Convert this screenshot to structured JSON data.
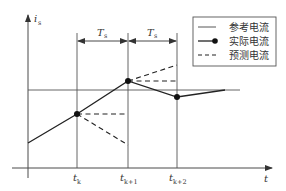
{
  "diagram": {
    "type": "predictive-current-control-timing",
    "axes": {
      "y_label_main": "i",
      "y_label_sub": "s",
      "x_label": "t"
    },
    "time_ticks": [
      {
        "main": "t",
        "sub": "k"
      },
      {
        "main": "t",
        "sub": "k+1"
      },
      {
        "main": "t",
        "sub": "k+2"
      }
    ],
    "intervals": [
      {
        "main": "T",
        "sub": "s"
      },
      {
        "main": "T",
        "sub": "s"
      }
    ],
    "legend": {
      "items": [
        {
          "label": "参考电流",
          "style": "thin-solid"
        },
        {
          "label": "实际电流",
          "style": "solid-with-dot"
        },
        {
          "label": "预测电流",
          "style": "dashed"
        }
      ]
    },
    "colors": {
      "line": "#222222",
      "axis": "#4a4a4a",
      "background": "#ffffff"
    }
  }
}
